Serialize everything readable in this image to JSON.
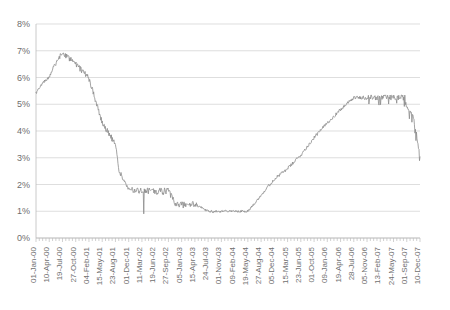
{
  "chart_data": {
    "type": "line",
    "title": "",
    "subtitle": "",
    "xlabel": "",
    "ylabel": "",
    "grid": true,
    "legend": false,
    "legend_position": "none",
    "line_color": "#8c8c8c",
    "grid_color": "#d0d0d0",
    "axis_color": "#bdbdbd",
    "background_color": "#ffffff",
    "ylim": [
      0,
      8
    ],
    "y_tick_labels": [
      "0%",
      "1%",
      "2%",
      "3%",
      "4%",
      "5%",
      "6%",
      "7%",
      "8%"
    ],
    "y_tick_values": [
      0,
      1,
      2,
      3,
      4,
      5,
      6,
      7,
      8
    ],
    "y_unit": "%",
    "x_tick_labels": [
      "01-Jan-00",
      "10-Apr-00",
      "19-Jul-00",
      "27-Oct-00",
      "04-Feb-01",
      "15-May-01",
      "23-Aug-01",
      "01-Dec-01",
      "11-Mar-02",
      "19-Jun-02",
      "27-Sep-02",
      "05-Jan-03",
      "15-Apr-03",
      "24-Jul-03",
      "01-Nov-03",
      "09-Feb-04",
      "19-May-04",
      "27-Aug-04",
      "05-Dec-04",
      "15-Mar-05",
      "23-Jun-05",
      "01-Oct-05",
      "09-Jan-06",
      "19-Apr-06",
      "28-Jul-06",
      "05-Nov-06",
      "13-Feb-07",
      "24-May-07",
      "01-Sep-07",
      "10-Dec-07"
    ],
    "x_minor_ticks_per_label": 3,
    "series": [
      {
        "name": "Rate",
        "units": "percent",
        "x_start": "01-Jan-00",
        "x_end": "10-Dec-07",
        "key_points": [
          {
            "x": "01-Jan-00",
            "y": 5.4
          },
          {
            "x": "20-Feb-00",
            "y": 5.8
          },
          {
            "x": "10-Apr-00",
            "y": 6.0
          },
          {
            "x": "20-May-00",
            "y": 6.5
          },
          {
            "x": "19-Jul-00",
            "y": 6.9
          },
          {
            "x": "27-Oct-00",
            "y": 6.5
          },
          {
            "x": "04-Feb-01",
            "y": 6.0
          },
          {
            "x": "15-May-01",
            "y": 4.3
          },
          {
            "x": "23-Aug-01",
            "y": 3.5
          },
          {
            "x": "20-Sep-01",
            "y": 2.5
          },
          {
            "x": "01-Dec-01",
            "y": 1.8
          },
          {
            "x": "11-Mar-02",
            "y": 1.75
          },
          {
            "x": "19-Jun-02",
            "y": 1.75
          },
          {
            "x": "27-Sep-02",
            "y": 1.75
          },
          {
            "x": "20-Nov-02",
            "y": 1.25
          },
          {
            "x": "05-Jan-03",
            "y": 1.25
          },
          {
            "x": "15-Apr-03",
            "y": 1.25
          },
          {
            "x": "24-Jul-03",
            "y": 1.0
          },
          {
            "x": "01-Nov-03",
            "y": 1.0
          },
          {
            "x": "09-Feb-04",
            "y": 1.0
          },
          {
            "x": "19-May-04",
            "y": 1.0
          },
          {
            "x": "30-Jun-04",
            "y": 1.25
          },
          {
            "x": "27-Aug-04",
            "y": 1.6
          },
          {
            "x": "05-Dec-04",
            "y": 2.2
          },
          {
            "x": "15-Mar-05",
            "y": 2.6
          },
          {
            "x": "23-Jun-05",
            "y": 3.1
          },
          {
            "x": "01-Oct-05",
            "y": 3.75
          },
          {
            "x": "09-Jan-06",
            "y": 4.3
          },
          {
            "x": "19-Apr-06",
            "y": 4.8
          },
          {
            "x": "28-Jul-06",
            "y": 5.25
          },
          {
            "x": "05-Nov-06",
            "y": 5.25
          },
          {
            "x": "13-Feb-07",
            "y": 5.25
          },
          {
            "x": "24-May-07",
            "y": 5.25
          },
          {
            "x": "18-Aug-07",
            "y": 5.25
          },
          {
            "x": "01-Sep-07",
            "y": 4.9
          },
          {
            "x": "20-Oct-07",
            "y": 4.6
          },
          {
            "x": "10-Dec-07",
            "y": 3.05
          }
        ],
        "min_value": 0.95,
        "max_value": 7.0,
        "first_value": 5.4,
        "last_value": 3.05
      }
    ]
  },
  "plot": {
    "left": 36,
    "top": 24,
    "right": 420,
    "bottom": 238
  }
}
